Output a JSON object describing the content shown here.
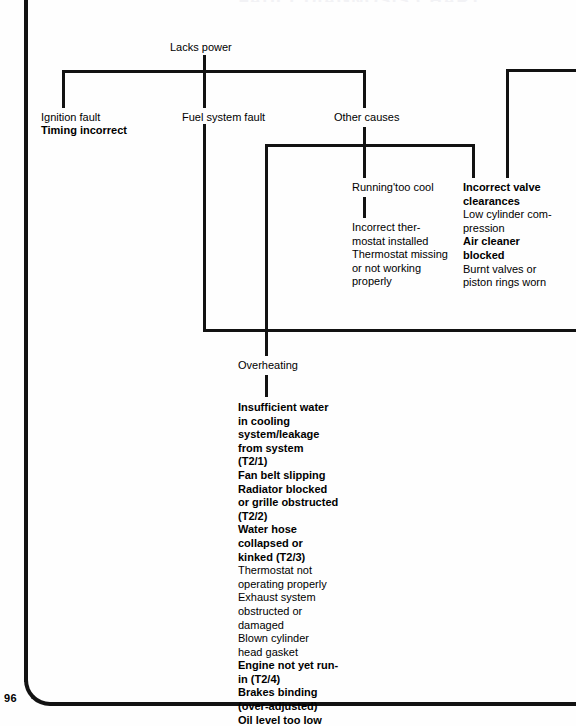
{
  "page": {
    "number": "96",
    "running_head": "FAULT DIAGNOSIS CHART",
    "ink_color": "#121212",
    "background_color": "#fefefe"
  },
  "diagram": {
    "type": "fault-diagnosis-tree",
    "root": "Lacks power",
    "nodes": {
      "root_label": "Lacks power",
      "ignition_fault": "Ignition fault",
      "fuel_system_fault": "Fuel system fault",
      "other_causes": "Other causes",
      "running_too_cool": "Running'too cool",
      "incorrect_valve_heading": "Incorrect valve",
      "overheating": "Overheating"
    },
    "branches": [
      {
        "name": "ignition-fault",
        "label": "Ignition fault",
        "causes": [
          {
            "text": "Timing incorrect",
            "bold": true
          }
        ]
      },
      {
        "name": "fuel-system-fault",
        "label": "Fuel system fault",
        "causes": []
      },
      {
        "name": "other-causes",
        "label": "Other causes",
        "causes": []
      },
      {
        "name": "running-too-cool",
        "label": "Running'too cool",
        "causes": [
          {
            "text": "Incorrect ther-",
            "bold": false
          },
          {
            "text": "mostat installed",
            "bold": false
          },
          {
            "text": "Thermostat missing",
            "bold": false
          },
          {
            "text": "or not working",
            "bold": false
          },
          {
            "text": "properly",
            "bold": false
          }
        ]
      },
      {
        "name": "incorrect-valve-clearances",
        "label": "Incorrect valve clearances",
        "causes": [
          {
            "text": "Incorrect valve",
            "bold": true
          },
          {
            "text": "clearances",
            "bold": true
          },
          {
            "text": "Low cylinder com-",
            "bold": false
          },
          {
            "text": "pression",
            "bold": false
          },
          {
            "text": "Air cleaner",
            "bold": true
          },
          {
            "text": "blocked",
            "bold": true
          },
          {
            "text": "Burnt valves or",
            "bold": false
          },
          {
            "text": "piston rings worn",
            "bold": false
          }
        ]
      },
      {
        "name": "overheating",
        "label": "Overheating",
        "causes": [
          {
            "text": "Insufficient water",
            "bold": true
          },
          {
            "text": "in cooling",
            "bold": true
          },
          {
            "text": "system/leakage",
            "bold": true
          },
          {
            "text": "from system",
            "bold": true
          },
          {
            "text": "(T2/1)",
            "bold": true
          },
          {
            "text": "Fan belt slipping",
            "bold": true
          },
          {
            "text": "Radiator blocked",
            "bold": true
          },
          {
            "text": "or grille obstructed",
            "bold": true
          },
          {
            "text": "(T2/2)",
            "bold": true
          },
          {
            "text": "Water hose",
            "bold": true
          },
          {
            "text": "collapsed or",
            "bold": true
          },
          {
            "text": "kinked (T2/3)",
            "bold": true
          },
          {
            "text": "Thermostat not",
            "bold": false
          },
          {
            "text": "operating properly",
            "bold": false
          },
          {
            "text": "Exhaust system",
            "bold": false
          },
          {
            "text": "obstructed or",
            "bold": false
          },
          {
            "text": "damaged",
            "bold": false
          },
          {
            "text": "Blown cylinder",
            "bold": false
          },
          {
            "text": "head gasket",
            "bold": false
          },
          {
            "text": "Engine not yet run-",
            "bold": true
          },
          {
            "text": "in (T2/4)",
            "bold": true
          },
          {
            "text": "Brakes binding",
            "bold": true
          },
          {
            "text": "(over-adjusted)",
            "bold": true
          },
          {
            "text": "Oil level too low",
            "bold": true
          }
        ]
      }
    ]
  }
}
